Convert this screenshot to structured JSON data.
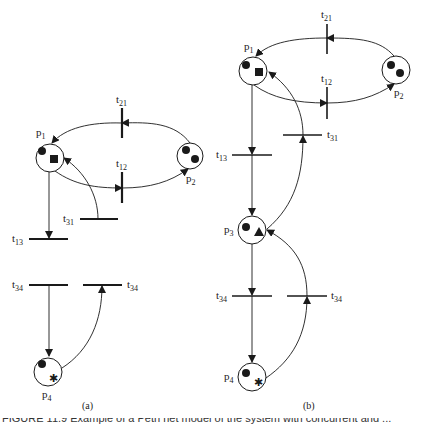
{
  "figure": {
    "panel_a": {
      "caption": "(a)",
      "places": [
        {
          "id": "p1",
          "name": "p",
          "sub": "1",
          "tokens": [
            "circle",
            "square"
          ]
        },
        {
          "id": "p2",
          "name": "p",
          "sub": "2",
          "tokens": [
            "circle",
            "circle"
          ]
        },
        {
          "id": "p4",
          "name": "p",
          "sub": "4",
          "tokens": [
            "circle",
            "star"
          ]
        }
      ],
      "transitions": [
        {
          "id": "t21",
          "name": "t",
          "sub": "21"
        },
        {
          "id": "t12",
          "name": "t",
          "sub": "12"
        },
        {
          "id": "t31",
          "name": "t",
          "sub": "31"
        },
        {
          "id": "t13",
          "name": "t",
          "sub": "13"
        },
        {
          "id": "t34a",
          "name": "t",
          "sub": "34"
        },
        {
          "id": "t34b",
          "name": "t",
          "sub": "34"
        }
      ]
    },
    "panel_b": {
      "caption": "(b)",
      "places": [
        {
          "id": "p1",
          "name": "p",
          "sub": "1",
          "tokens": [
            "circle",
            "square"
          ]
        },
        {
          "id": "p2",
          "name": "p",
          "sub": "2",
          "tokens": [
            "circle",
            "circle"
          ]
        },
        {
          "id": "p3",
          "name": "p",
          "sub": "3",
          "tokens": [
            "circle",
            "triangle"
          ]
        },
        {
          "id": "p4",
          "name": "p",
          "sub": "4",
          "tokens": [
            "circle",
            "star"
          ]
        }
      ],
      "transitions": [
        {
          "id": "t21",
          "name": "t",
          "sub": "21"
        },
        {
          "id": "t12",
          "name": "t",
          "sub": "12"
        },
        {
          "id": "t31",
          "name": "t",
          "sub": "31"
        },
        {
          "id": "t13",
          "name": "t",
          "sub": "13"
        },
        {
          "id": "t34a",
          "name": "t",
          "sub": "34"
        },
        {
          "id": "t34b",
          "name": "t",
          "sub": "34"
        }
      ]
    },
    "clipped_caption": "FIGURE 11.9  Example of a Petri net model of the system with concurrent and ..."
  },
  "colors": {
    "ink": "#1a1a1a",
    "background": "#ffffff"
  }
}
